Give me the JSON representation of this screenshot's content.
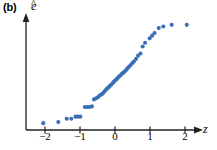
{
  "figure": {
    "panel_label": "(b)",
    "ylabel_base": "e",
    "ylabel_hat": "^",
    "xlabel": "z",
    "point_color": "#3a6fb8",
    "axis_color": "#231f20",
    "background": "#ffffff"
  },
  "chart_data": {
    "type": "scatter",
    "title": "",
    "subtitle": "",
    "xlabel": "z",
    "ylabel": "e-hat",
    "xlim": [
      -2.45,
      2.4
    ],
    "ylim": [
      0,
      1
    ],
    "grid": false,
    "legend": null,
    "xticks": [
      -2,
      -1,
      0,
      1,
      2
    ],
    "xticklabels": [
      "−2",
      "−1",
      "0",
      "1",
      "2"
    ],
    "yticks": [],
    "yticklabels": [],
    "series": [
      {
        "name": "standardized residuals",
        "marker": "circle",
        "color": "#3a6fb8",
        "x": [
          -2.05,
          -1.62,
          -1.38,
          -1.25,
          -1.13,
          -1.06,
          -0.99,
          -0.86,
          -0.79,
          -0.73,
          -0.66,
          -0.6,
          -0.54,
          -0.49,
          -0.44,
          -0.39,
          -0.35,
          -0.31,
          -0.27,
          -0.23,
          -0.19,
          -0.15,
          -0.11,
          -0.07,
          -0.04,
          0.0,
          0.04,
          0.07,
          0.11,
          0.15,
          0.19,
          0.23,
          0.27,
          0.31,
          0.35,
          0.39,
          0.44,
          0.49,
          0.54,
          0.6,
          0.66,
          0.73,
          0.79,
          0.86,
          0.99,
          1.06,
          1.13,
          1.25,
          1.38,
          1.62,
          2.05
        ],
        "y": [
          0.045,
          0.055,
          0.085,
          0.085,
          0.105,
          0.105,
          0.105,
          0.195,
          0.195,
          0.195,
          0.2,
          0.265,
          0.275,
          0.285,
          0.3,
          0.31,
          0.32,
          0.335,
          0.35,
          0.365,
          0.375,
          0.39,
          0.4,
          0.415,
          0.425,
          0.44,
          0.45,
          0.46,
          0.475,
          0.485,
          0.5,
          0.51,
          0.52,
          0.535,
          0.55,
          0.565,
          0.58,
          0.6,
          0.615,
          0.64,
          0.67,
          0.69,
          0.755,
          0.79,
          0.83,
          0.855,
          0.88,
          0.925,
          0.94,
          0.955,
          0.955
        ]
      }
    ]
  }
}
